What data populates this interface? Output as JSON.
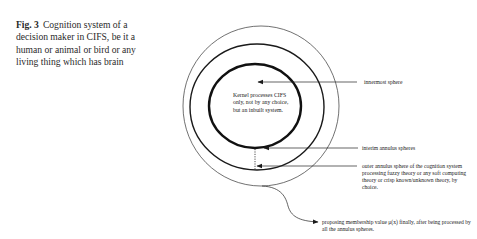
{
  "caption": {
    "figure_label": "Fig. 3",
    "text": "Cognition system of a decision maker in CIFS, be it a human or animal or bird or any living thing which has brain"
  },
  "diagram": {
    "kernel_text": "Kernel processes CIFS only, not by any choice, but an inbuilt system.",
    "labels": {
      "innermost": "innermost sphere",
      "interim": "interim annulus spheres",
      "outer": "outer annulus sphere of the cognition system processing fuzzy theory or any soft computing theory or crisp known/unknown theory, by choice.",
      "output": "proposing membership value μ(x) finally, after being processed by all the annulus spheres."
    },
    "colors": {
      "line": "#1a1a1a",
      "text": "#222222",
      "background": "#ffffff"
    }
  }
}
